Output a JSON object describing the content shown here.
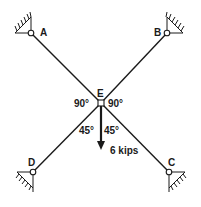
{
  "diagram": {
    "type": "structural-truss",
    "nodes": {
      "A": {
        "label": "A",
        "x": 31,
        "y": 33
      },
      "B": {
        "label": "B",
        "x": 167,
        "y": 33
      },
      "C": {
        "label": "C",
        "x": 169,
        "y": 172
      },
      "D": {
        "label": "D",
        "x": 33,
        "y": 172
      },
      "E": {
        "label": "E",
        "x": 101,
        "y": 103
      }
    },
    "members": [
      "AE",
      "BE",
      "CE",
      "DE"
    ],
    "supports": [
      "A",
      "B",
      "C",
      "D"
    ],
    "angles": {
      "upper_left": "90°",
      "upper_right": "90°",
      "lower_left": "45°",
      "lower_right": "45°"
    },
    "load": {
      "at": "E",
      "direction": "down",
      "label": "6 kips"
    },
    "colors": {
      "line": "#1a1a1a",
      "background": "#ffffff"
    }
  }
}
